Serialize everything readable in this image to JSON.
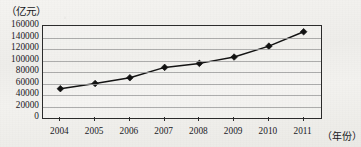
{
  "chart_data": {
    "type": "line",
    "title": "",
    "subtitle": "",
    "xlabel": "（年份）",
    "ylabel": "（亿元）",
    "categories": [
      "2004",
      "2005",
      "2006",
      "2007",
      "2008",
      "2009",
      "2010",
      "2011"
    ],
    "values": [
      51000,
      60000,
      70000,
      88000,
      95000,
      106000,
      125000,
      150000
    ],
    "series": [
      {
        "name": "",
        "values": [
          51000,
          60000,
          70000,
          88000,
          95000,
          106000,
          125000,
          150000
        ]
      }
    ],
    "ylim": [
      0,
      160000
    ],
    "yticks": [
      0,
      20000,
      40000,
      60000,
      80000,
      100000,
      120000,
      140000,
      160000
    ],
    "ytick_labels": [
      "0",
      "20000",
      "40000",
      "60000",
      "80000",
      "100000",
      "120000",
      "140000",
      "160000"
    ],
    "xtick_labels": [
      "2004",
      "2005",
      "2006",
      "2007",
      "2008",
      "2009",
      "2010",
      "2011"
    ],
    "grid": "horizontal",
    "legend": "none",
    "marker": "diamond",
    "line_color": "#121212",
    "marker_color": "#101010",
    "grid_color": "#9c9c9c",
    "axis_color": "#2b2b2b"
  }
}
